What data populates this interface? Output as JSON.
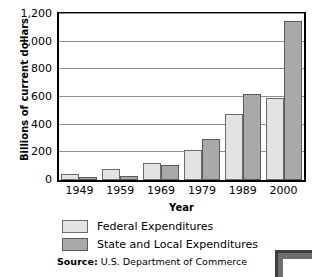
{
  "chart_data": {
    "type": "bar",
    "title": "",
    "xlabel": "Year",
    "ylabel": "Billions of current dollars",
    "categories": [
      "1949",
      "1959",
      "1969",
      "1979",
      "1989",
      "2000"
    ],
    "series": [
      {
        "name": "Federal Expenditures",
        "color": "#e3e3e3",
        "values": [
          40,
          80,
          125,
          220,
          480,
          590
        ]
      },
      {
        "name": "State and Local Expenditures",
        "color": "#a9a9a9",
        "values": [
          20,
          30,
          110,
          300,
          620,
          1150
        ]
      }
    ],
    "ylim": [
      0,
      1200
    ],
    "ytick_values": [
      0,
      200,
      400,
      600,
      800,
      1000,
      1200
    ],
    "ytick_labels": [
      "0",
      "200",
      "400",
      "600",
      "800",
      "1,000",
      "1,200"
    ],
    "grid": true,
    "legend_position": "bottom"
  },
  "source": {
    "label": "Source",
    "separator": ":",
    "text": "U.S. Department of Commerce"
  }
}
